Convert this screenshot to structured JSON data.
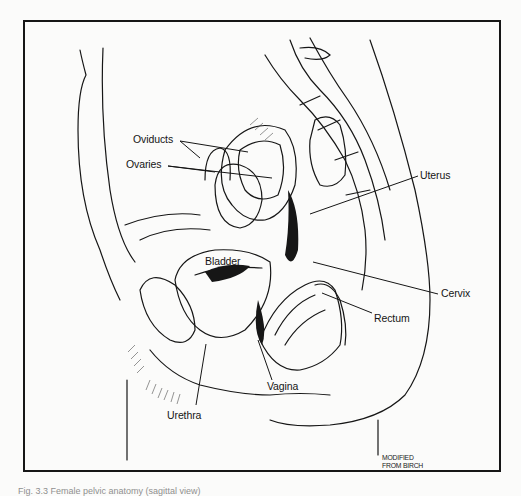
{
  "figure": {
    "type": "anatomical line drawing",
    "view": "sagittal section of the female pelvis",
    "labels": {
      "oviducts": "Oviducts",
      "ovaries": "Ovaries",
      "uterus": "Uterus",
      "bladder": "Bladder",
      "cervix": "Cervix",
      "rectum": "Rectum",
      "vagina": "Vagina",
      "urethra": "Urethra"
    },
    "credit_line1": "MODIFIED",
    "credit_line2": "FROM BIRCH",
    "caption": "Fig. 3.3 Female pelvic anatomy (sagittal view)"
  },
  "colors": {
    "ink": "#161616",
    "paper": "#fbfbfa"
  }
}
